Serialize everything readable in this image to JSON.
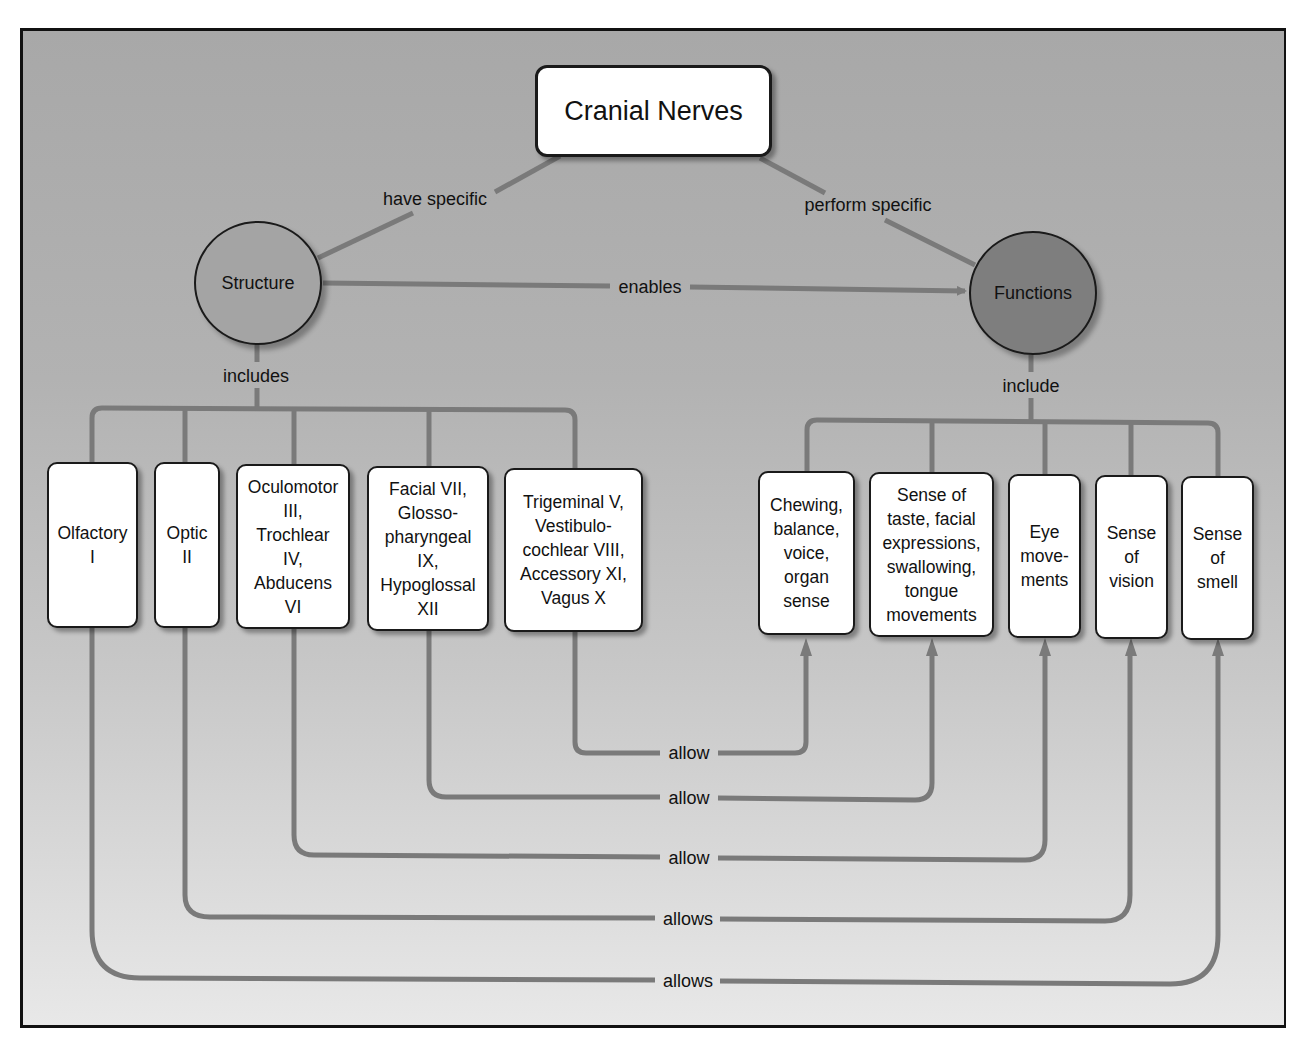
{
  "title": "Cranial Nerves",
  "concepts": {
    "structure": "Structure",
    "functions": "Functions"
  },
  "link_labels": {
    "have_specific": "have specific",
    "perform_specific": "perform specific",
    "enables": "enables",
    "includes": "includes",
    "include": "include"
  },
  "structures": [
    {
      "label": "Olfactory\nI"
    },
    {
      "label": "Optic\nII"
    },
    {
      "label": "Oculomotor\nIII,\nTrochlear\nIV,\nAbducens\nVI"
    },
    {
      "label": "Facial VII,\nGlosso-\npharyngeal\nIX,\nHypoglossal\nXII"
    },
    {
      "label": "Trigeminal V,\nVestibulo-\ncochlear VIII,\nAccessory XI,\nVagus X"
    }
  ],
  "functions": [
    {
      "label": "Chewing,\nbalance,\nvoice,\norgan\nsense"
    },
    {
      "label": "Sense of\ntaste, facial\nexpressions,\nswallowing,\ntongue\nmovements"
    },
    {
      "label": "Eye\nmove-\nments"
    },
    {
      "label": "Sense\nof\nvision"
    },
    {
      "label": "Sense\nof\nsmell"
    }
  ],
  "relations": [
    {
      "from": "Trigeminal V, Vestibulocochlear VIII, Accessory XI, Vagus X",
      "label": "allow",
      "to": "Chewing, balance, voice, organ sense"
    },
    {
      "from": "Facial VII, Glossopharyngeal IX, Hypoglossal XII",
      "label": "allow",
      "to": "Sense of taste, facial expressions, swallowing, tongue movements"
    },
    {
      "from": "Oculomotor III, Trochlear IV, Abducens VI",
      "label": "allow",
      "to": "Eye movements"
    },
    {
      "from": "Optic II",
      "label": "allows",
      "to": "Sense of vision"
    },
    {
      "from": "Olfactory I",
      "label": "allows",
      "to": "Sense of smell"
    }
  ],
  "colors": {
    "line": "#7a7a7a",
    "structure_fill": "#a4a4a4",
    "functions_fill": "#7e7e7e",
    "node_fill": "#ffffff",
    "border": "#1a1a1a"
  }
}
